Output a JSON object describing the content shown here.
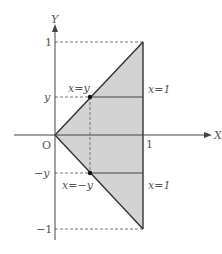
{
  "diagram": {
    "axes": {
      "x_label": "X",
      "y_label": "Y",
      "origin_label": "O"
    },
    "ticks": {
      "x_one": "1",
      "y_one": "1",
      "y_minus_one": "−1",
      "y_level": "y",
      "y_neg_level": "−y"
    },
    "line_labels": {
      "upper_diagonal": "x=y",
      "lower_diagonal": "x=−y",
      "upper_horizontal": "x=1",
      "lower_horizontal": "x=1"
    },
    "colors": {
      "fill": "#d3d3d3",
      "line": "#333333",
      "dashed": "#777777"
    }
  }
}
